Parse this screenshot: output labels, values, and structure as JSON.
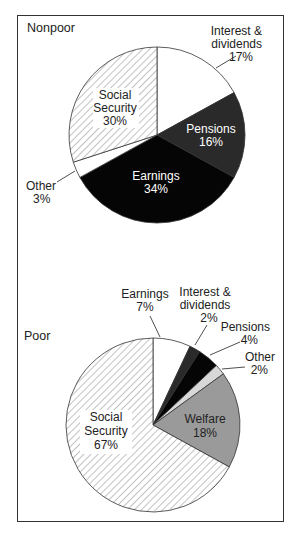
{
  "chart_data": [
    {
      "type": "pie",
      "title": "Nonpoor",
      "categories": [
        "Interest & dividends",
        "Pensions",
        "Earnings",
        "Other",
        "Social Security"
      ],
      "values": [
        17,
        16,
        34,
        3,
        30
      ],
      "unit": "%",
      "fills": [
        "#ffffff",
        "#2a2a2a",
        "#050505",
        "#ffffff",
        "hatch"
      ]
    },
    {
      "type": "pie",
      "title": "Poor",
      "categories": [
        "Earnings",
        "Interest & dividends",
        "Pensions",
        "Other",
        "Welfare",
        "Social Security"
      ],
      "values": [
        7,
        2,
        4,
        2,
        18,
        67
      ],
      "unit": "%",
      "fills": [
        "#ffffff",
        "#2a2a2a",
        "#050505",
        "#d8d8d8",
        "#9a9a9a",
        "hatch"
      ]
    }
  ],
  "labels": {
    "nonpoor": {
      "title": "Nonpoor",
      "interest_l1": "Interest &",
      "interest_l2": "dividends",
      "interest_pct": "17%",
      "pensions": "Pensions",
      "pensions_pct": "16%",
      "earnings": "Earnings",
      "earnings_pct": "34%",
      "other": "Other",
      "other_pct": "3%",
      "ss_l1": "Social",
      "ss_l2": "Security",
      "ss_pct": "30%"
    },
    "poor": {
      "title": "Poor",
      "earnings": "Earnings",
      "earnings_pct": "7%",
      "interest_l1": "Interest &",
      "interest_l2": "dividends",
      "interest_pct": "2%",
      "pensions": "Pensions",
      "pensions_pct": "4%",
      "other": "Other",
      "other_pct": "2%",
      "welfare": "Welfare",
      "welfare_pct": "18%",
      "ss_l1": "Social",
      "ss_l2": "Security",
      "ss_pct": "67%"
    }
  }
}
